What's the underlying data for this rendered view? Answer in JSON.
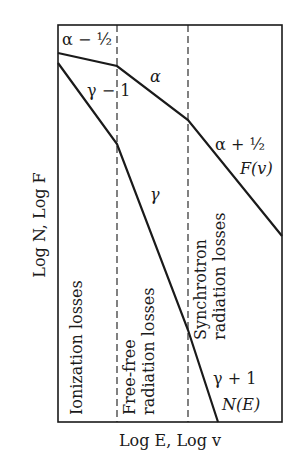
{
  "axes": {
    "x_label": "Log E, Log v",
    "y_label": "Log N, Log F"
  },
  "regions": [
    {
      "label": "Ionization losses"
    },
    {
      "label_line1": "Free-free",
      "label_line2": "radiation losses"
    },
    {
      "label_line1": "Synchrotron",
      "label_line2": "radiation losses"
    }
  ],
  "curves": {
    "F": {
      "name": "F(v)",
      "segment_labels": [
        "α − ½",
        "α",
        "α + ½"
      ]
    },
    "N": {
      "name": "N(E)",
      "segment_labels": [
        "γ − 1",
        "γ",
        "γ + 1"
      ]
    }
  },
  "colors": {
    "line": "#1a1a1a",
    "background": "#ffffff"
  }
}
